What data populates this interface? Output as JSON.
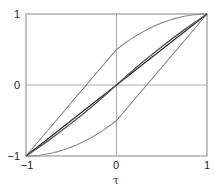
{
  "chart_data": {
    "type": "line",
    "title": "",
    "xlabel": "τ",
    "ylabel": "",
    "xlim": [
      -1,
      1
    ],
    "ylim": [
      -1,
      1
    ],
    "xticks": [
      "−1",
      "0",
      "1"
    ],
    "yticks": [
      "1",
      "0",
      "−1"
    ],
    "grid": "zero-lines",
    "legend": null,
    "series": [
      {
        "name": "upper-bound",
        "color": "#8a8a8a",
        "x": [
          -1,
          -0.5,
          0,
          0.25,
          0.5,
          0.75,
          1
        ],
        "y": [
          -1,
          -0.25,
          0.5,
          0.72,
          0.875,
          0.97,
          1
        ]
      },
      {
        "name": "lower-bound",
        "color": "#8a8a8a",
        "x": [
          -1,
          -0.75,
          -0.5,
          -0.25,
          0,
          0.5,
          1
        ],
        "y": [
          -1,
          -0.97,
          -0.875,
          -0.72,
          -0.5,
          0.25,
          1
        ]
      },
      {
        "name": "diagonal",
        "color": "#333333",
        "x": [
          -1,
          0,
          1
        ],
        "y": [
          -1,
          0,
          1
        ]
      },
      {
        "name": "s-curve",
        "color": "#555555",
        "x": [
          -1,
          -0.75,
          -0.5,
          -0.25,
          0,
          0.25,
          0.5,
          0.75,
          1
        ],
        "y": [
          -1,
          -0.78,
          -0.54,
          -0.28,
          0,
          0.28,
          0.54,
          0.78,
          1
        ]
      }
    ]
  }
}
